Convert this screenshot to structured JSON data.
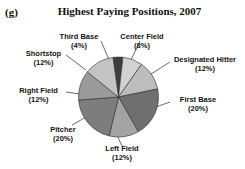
{
  "figure": {
    "panel_label": "(g)",
    "title": "Highest Paying Positions, 2007"
  },
  "chart_data": {
    "type": "pie",
    "title": "Highest Paying Positions, 2007",
    "xlabel": "",
    "ylabel": "",
    "legend_position": "none",
    "labels_outside": true,
    "categories": [
      "Third Base",
      "Center Field",
      "Designated Hitter",
      "First Base",
      "Left Field",
      "Pitcher",
      "Right Field",
      "Shortstop"
    ],
    "values": [
      4,
      8,
      12,
      20,
      12,
      20,
      12,
      12
    ],
    "units": "percent",
    "total": 100,
    "slices": [
      {
        "label": "Third Base",
        "percent": 4,
        "text": "Third Base",
        "pct_text": "(4%)",
        "color": "#3d3d3d"
      },
      {
        "label": "Center Field",
        "percent": 8,
        "text": "Center Field",
        "pct_text": "(8%)",
        "color": "#d2d2d2"
      },
      {
        "label": "Designated Hitter",
        "percent": 12,
        "text": "Designated Hitter",
        "pct_text": "(12%)",
        "color": "#bdbdbd"
      },
      {
        "label": "First Base",
        "percent": 20,
        "text": "First Base",
        "pct_text": "(20%)",
        "color": "#6f6f6f"
      },
      {
        "label": "Left Field",
        "percent": 12,
        "text": "Left Field",
        "pct_text": "(12%)",
        "color": "#a3a3a3"
      },
      {
        "label": "Pitcher",
        "percent": 20,
        "text": "Pitcher",
        "pct_text": "(20%)",
        "color": "#7d7d7d"
      },
      {
        "label": "Right Field",
        "percent": 12,
        "text": "Right Field",
        "pct_text": "(12%)",
        "color": "#9a9a9a"
      },
      {
        "label": "Shortstop",
        "percent": 12,
        "text": "Shortstop",
        "pct_text": "(12%)",
        "color": "#c4c4c4"
      }
    ]
  }
}
